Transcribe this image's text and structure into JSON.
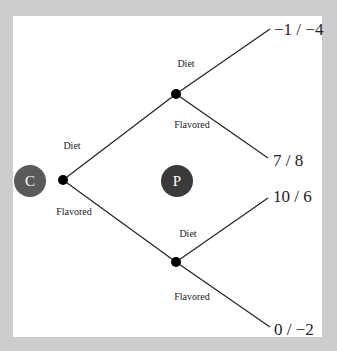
{
  "diagram": {
    "type": "game-tree",
    "players": {
      "first": {
        "label": "C",
        "color": "#5a5a5a"
      },
      "second": {
        "label": "P",
        "color": "#3a3a3a"
      }
    },
    "root_branches": {
      "upper": "Diet",
      "lower": "Flavored"
    },
    "upper_node_branches": {
      "upper": "Diet",
      "lower": "Flavored"
    },
    "lower_node_branches": {
      "upper": "Diet",
      "lower": "Flavored"
    },
    "payoffs": [
      "−1 / −4",
      "7 / 8",
      "10 / 6",
      "0 / −2"
    ]
  }
}
